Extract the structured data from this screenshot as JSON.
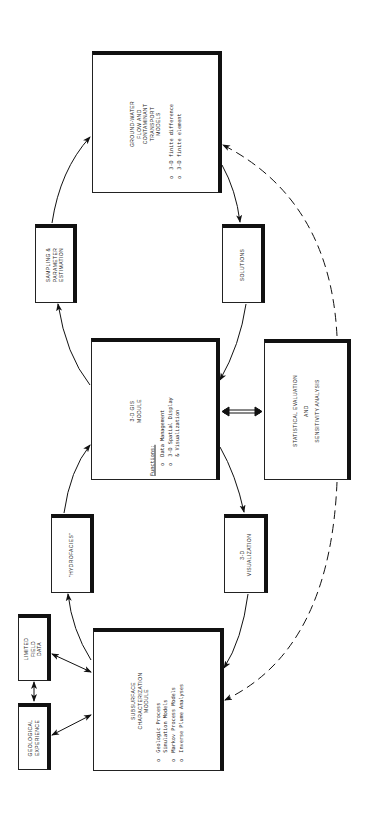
{
  "diagram": {
    "orientation": "rotated-90-ccw",
    "nodes": {
      "groundwater": {
        "title_lines": [
          "GROUND-WATER",
          "FLOW AND",
          "CONTAMINANT",
          "TRANSPORT",
          "MODELS"
        ],
        "bullets": [
          "o  3-D finite difference",
          "o  3-D finite element"
        ]
      },
      "sampling": {
        "title_lines": [
          "SAMPLING &",
          "PARAMETER",
          "ESTIMATION"
        ]
      },
      "solutions": {
        "title_lines": [
          "SOLUTIONS"
        ]
      },
      "gis": {
        "title_lines": [
          "3-D GIS",
          "MODULE"
        ],
        "functions_label": "Functions:",
        "bullets": [
          "o  Data Management",
          "o  3-D Spatial Display",
          "   & Visualization"
        ]
      },
      "statistical": {
        "title_lines": [
          "STATISTICAL EVALUATION",
          "AND",
          "SENSITIVITY ANALYSIS"
        ]
      },
      "hydrofacies": {
        "title_lines": [
          "\"HYDROFACIES\""
        ]
      },
      "visualization": {
        "title_lines": [
          "3-D",
          "VISUALIZATION"
        ]
      },
      "subsurface": {
        "title_lines": [
          "SUBSURFACE",
          "CHARACTERIZATION",
          "MODULE"
        ],
        "bullets": [
          "o  Geologic Process",
          "   Simulation Models",
          "o  Markov Process Models",
          "o  Inverse Plume Analyses"
        ]
      },
      "field_data": {
        "title_lines": [
          "LIMITED",
          "FIELD",
          "DATA"
        ]
      },
      "geo_experience": {
        "title_lines": [
          "GEOLOGICAL",
          "EXPERIENCE"
        ]
      }
    },
    "edges": [
      {
        "from": "subsurface",
        "to": "hydrofacies",
        "style": "solid"
      },
      {
        "from": "hydrofacies",
        "to": "gis",
        "style": "solid"
      },
      {
        "from": "gis",
        "to": "sampling",
        "style": "solid"
      },
      {
        "from": "sampling",
        "to": "groundwater",
        "style": "solid"
      },
      {
        "from": "groundwater",
        "to": "solutions",
        "style": "solid"
      },
      {
        "from": "solutions",
        "to": "gis",
        "style": "solid"
      },
      {
        "from": "gis",
        "to": "visualization",
        "style": "solid"
      },
      {
        "from": "visualization",
        "to": "subsurface",
        "style": "solid"
      },
      {
        "from": "gis",
        "to": "statistical",
        "style": "double-bidirectional"
      },
      {
        "from": "statistical",
        "to": "subsurface",
        "style": "dashed"
      },
      {
        "from": "statistical",
        "to": "groundwater",
        "style": "dashed"
      },
      {
        "from": "field_data",
        "to": "subsurface",
        "style": "bidirectional"
      },
      {
        "from": "geo_experience",
        "to": "subsurface",
        "style": "bidirectional"
      },
      {
        "from": "field_data",
        "to": "geo_experience",
        "style": "bidirectional"
      }
    ]
  }
}
